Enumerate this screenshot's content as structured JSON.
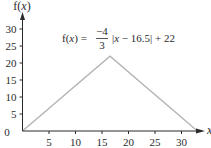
{
  "chart_data": {
    "type": "line",
    "title": "",
    "annotation": {
      "prefix": "f(x) =",
      "numerator": "−4",
      "denominator": "3",
      "suffix": "|x − 16.5| + 22"
    },
    "xlabel": "x",
    "ylabel": "f(x)",
    "xlim": [
      0,
      34
    ],
    "ylim": [
      0,
      32
    ],
    "x_ticks": [
      5,
      10,
      15,
      20,
      25,
      30
    ],
    "y_ticks": [
      5,
      10,
      15,
      20,
      25,
      30
    ],
    "origin_label": "0",
    "grid": false,
    "series": [
      {
        "name": "f(x) = -4/3 |x - 16.5| + 22",
        "x": [
          0,
          16.5,
          33
        ],
        "y": [
          0,
          22,
          0
        ],
        "color": "#b3b3b3"
      }
    ]
  }
}
